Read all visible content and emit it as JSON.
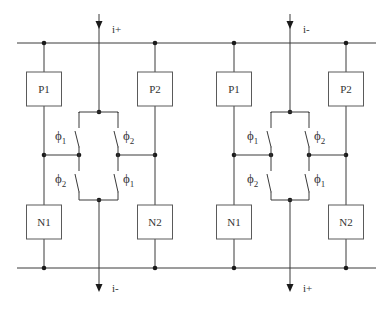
{
  "diagram": {
    "title": "",
    "cells": [
      {
        "id": "left",
        "top_current": "i+",
        "bottom_current": "i-",
        "blocks": {
          "top_left": "P1",
          "top_right": "P2",
          "bottom_left": "N1",
          "bottom_right": "N2"
        },
        "switches": {
          "upper_left": {
            "symbol": "ϕ",
            "sub": "1"
          },
          "upper_right": {
            "symbol": "ϕ",
            "sub": "2"
          },
          "lower_left": {
            "symbol": "ϕ",
            "sub": "2"
          },
          "lower_right": {
            "symbol": "ϕ",
            "sub": "1"
          }
        }
      },
      {
        "id": "right",
        "top_current": "i-",
        "bottom_current": "i+",
        "blocks": {
          "top_left": "P1",
          "top_right": "P2",
          "bottom_left": "N1",
          "bottom_right": "N2"
        },
        "switches": {
          "upper_left": {
            "symbol": "ϕ",
            "sub": "1"
          },
          "upper_right": {
            "symbol": "ϕ",
            "sub": "2"
          },
          "lower_left": {
            "symbol": "ϕ",
            "sub": "2"
          },
          "lower_right": {
            "symbol": "ϕ",
            "sub": "1"
          }
        }
      }
    ],
    "colors": {
      "wire": "#3a3a3a",
      "node": "#1a1a1a",
      "text": "#333333"
    }
  }
}
